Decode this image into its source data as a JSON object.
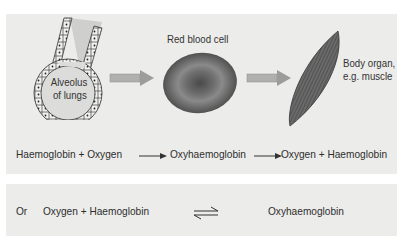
{
  "diagram": {
    "labels": {
      "alveolus": [
        "Alveolus",
        "of lungs"
      ],
      "red_blood_cell": "Red blood cell",
      "body_organ": [
        "Body organ,",
        "e.g. muscle"
      ]
    },
    "equation_forward": {
      "reactant_1": "Haemoglobin",
      "plus": "+",
      "reactant_2": "Oxygen",
      "product": "Oxyhaemoglobin",
      "result_1": "Oxygen",
      "result_2": "Haemoglobin"
    },
    "equation_reversible": {
      "prefix": "Or",
      "left": "Oxygen + Haemoglobin",
      "right": "Oxyhaemoglobin"
    },
    "colors": {
      "panel": "#ececea",
      "arrow": "#a8a8a8",
      "rbc": "#6a6a6a",
      "muscle": "#5a5a5a"
    }
  }
}
